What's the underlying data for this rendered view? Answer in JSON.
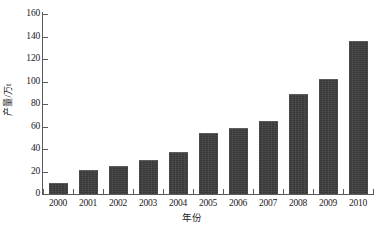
{
  "chart_data": {
    "type": "bar",
    "title": "",
    "xlabel": "年份",
    "ylabel": "产量/万t",
    "categories": [
      "2000",
      "2001",
      "2002",
      "2003",
      "2004",
      "2005",
      "2006",
      "2007",
      "2008",
      "2009",
      "2010"
    ],
    "values": [
      10,
      21,
      25,
      30.5,
      37,
      54,
      59,
      65,
      89,
      102,
      136
    ],
    "ylim": [
      0,
      160
    ],
    "ytick_labels": [
      "0",
      "20",
      "40",
      "60",
      "80",
      "100",
      "120",
      "140",
      "160"
    ],
    "ytick_values": [
      0,
      20,
      40,
      60,
      80,
      100,
      120,
      140,
      160
    ],
    "grid": false,
    "legend": null,
    "bar_color": "#3c3c3c",
    "axis_color": "#5a5a5a",
    "background_color": "#ffffff"
  }
}
